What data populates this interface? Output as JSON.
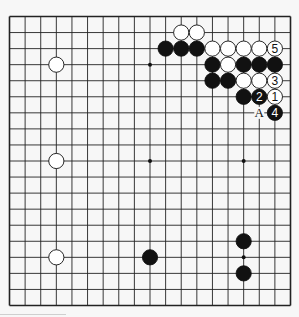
{
  "diagram": {
    "type": "go-board",
    "size": 19,
    "colors": {
      "background": "#f7f7f7",
      "line": "#222222",
      "black": "#111111",
      "white": "#ffffff"
    },
    "hoshi": [
      [
        3,
        3
      ],
      [
        3,
        9
      ],
      [
        3,
        15
      ],
      [
        9,
        3
      ],
      [
        9,
        9
      ],
      [
        9,
        15
      ],
      [
        15,
        3
      ],
      [
        15,
        9
      ],
      [
        15,
        15
      ]
    ],
    "stones": [
      {
        "color": "white",
        "row": 1,
        "col": 11
      },
      {
        "color": "white",
        "row": 1,
        "col": 12
      },
      {
        "color": "black",
        "row": 2,
        "col": 10
      },
      {
        "color": "black",
        "row": 2,
        "col": 11
      },
      {
        "color": "black",
        "row": 2,
        "col": 12
      },
      {
        "color": "white",
        "row": 2,
        "col": 13
      },
      {
        "color": "white",
        "row": 2,
        "col": 14
      },
      {
        "color": "white",
        "row": 2,
        "col": 15
      },
      {
        "color": "white",
        "row": 2,
        "col": 16
      },
      {
        "color": "white",
        "row": 2,
        "col": 17,
        "label": "5"
      },
      {
        "color": "black",
        "row": 3,
        "col": 13
      },
      {
        "color": "white",
        "row": 3,
        "col": 14
      },
      {
        "color": "black",
        "row": 3,
        "col": 15
      },
      {
        "color": "black",
        "row": 3,
        "col": 16
      },
      {
        "color": "black",
        "row": 3,
        "col": 17
      },
      {
        "color": "black",
        "row": 4,
        "col": 13
      },
      {
        "color": "black",
        "row": 4,
        "col": 14
      },
      {
        "color": "white",
        "row": 4,
        "col": 15
      },
      {
        "color": "white",
        "row": 4,
        "col": 16
      },
      {
        "color": "white",
        "row": 4,
        "col": 17,
        "label": "3"
      },
      {
        "color": "black",
        "row": 5,
        "col": 15
      },
      {
        "color": "black",
        "row": 5,
        "col": 16,
        "label": "2"
      },
      {
        "color": "white",
        "row": 5,
        "col": 17,
        "label": "1"
      },
      {
        "color": "black",
        "row": 6,
        "col": 17,
        "label": "4"
      },
      {
        "color": "white",
        "row": 3,
        "col": 3
      },
      {
        "color": "white",
        "row": 9,
        "col": 3
      },
      {
        "color": "white",
        "row": 15,
        "col": 3
      },
      {
        "color": "black",
        "row": 15,
        "col": 9
      },
      {
        "color": "black",
        "row": 14,
        "col": 15
      },
      {
        "color": "black",
        "row": 16,
        "col": 15
      }
    ],
    "markers": [
      {
        "row": 6,
        "col": 16,
        "label": "A"
      }
    ]
  }
}
